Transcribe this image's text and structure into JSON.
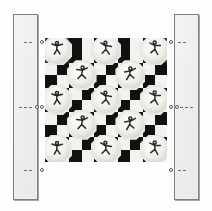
{
  "figure": {
    "background_color": "#fefefe"
  },
  "panels": [
    {
      "name": "left-rail",
      "label": "",
      "x": 13,
      "y": 14,
      "width": 25,
      "height": 186,
      "fill": "#f1f1f1",
      "stroke": "#7d7d7d"
    },
    {
      "name": "right-rail",
      "label": "",
      "x": 174,
      "y": 14,
      "width": 25,
      "height": 186,
      "fill": "#f1f1f1",
      "stroke": "#7d7d7d"
    }
  ],
  "board": {
    "name": "checkerboard-panel",
    "x": 45,
    "y": 38,
    "width": 122,
    "height": 124,
    "columns": 10,
    "rows": 10,
    "dark_color": "#111111",
    "light_color": "#f3f2ee",
    "mid_color": "#3a3a3a",
    "pattern": [
      "MMDLDLDLDM",
      "MMDLDLDLDM",
      "LDLDLDLDLD",
      "DLDLDLDLDL",
      "LDLDLDLDLD",
      "DLDLDLDLDL",
      "LDLDLDLDLD",
      "DLDLDLDLDL",
      "LDLDLDLDLD",
      "DLDLDLDLDL"
    ]
  },
  "medallions": {
    "name": "figure-medallion",
    "size": 30,
    "fill": "#e8e7e2",
    "items": [
      {
        "row": 0,
        "col": 0,
        "figure": "dancer-arms-raised"
      },
      {
        "row": 0,
        "col": 2,
        "figure": "dancer-striding"
      },
      {
        "row": 0,
        "col": 4,
        "figure": "dancer-leaping"
      },
      {
        "row": 1,
        "col": 1,
        "figure": "dancer-kneeling"
      },
      {
        "row": 1,
        "col": 3,
        "figure": "dancer-turning"
      },
      {
        "row": 2,
        "col": 0,
        "figure": "dancer-crouching"
      },
      {
        "row": 2,
        "col": 2,
        "figure": "dancer-running"
      },
      {
        "row": 2,
        "col": 4,
        "figure": "dancer-reaching"
      },
      {
        "row": 3,
        "col": 1,
        "figure": "dancer-bowing"
      },
      {
        "row": 3,
        "col": 3,
        "figure": "dancer-spinning"
      },
      {
        "row": 4,
        "col": 0,
        "figure": "dancer-stretching"
      },
      {
        "row": 4,
        "col": 2,
        "figure": "dancer-stepping"
      },
      {
        "row": 4,
        "col": 4,
        "figure": "dancer-jumping"
      }
    ]
  },
  "connectors": [
    {
      "name": "connector-top-left",
      "side": "left",
      "y": 42,
      "dash_from": 24,
      "dash_to": 34,
      "node_x": 40,
      "style": "dashed"
    },
    {
      "name": "connector-middle-left",
      "side": "left",
      "y": 107,
      "dash_from": 19,
      "dash_to": 33,
      "node_x": 40,
      "extra_node_x": 35,
      "style": "dashed"
    },
    {
      "name": "connector-bottom-left",
      "side": "left",
      "y": 170,
      "dash_from": 24,
      "dash_to": 34,
      "node_x": 40,
      "style": "dashed"
    },
    {
      "name": "connector-top-right",
      "side": "right",
      "y": 42,
      "dash_from": 178,
      "dash_to": 188,
      "node_x": 169,
      "style": "dashed"
    },
    {
      "name": "connector-middle-right",
      "side": "right",
      "y": 107,
      "dash_from": 180,
      "dash_to": 194,
      "node_x": 169,
      "extra_node_x": 175,
      "style": "dashed"
    },
    {
      "name": "connector-bottom-right",
      "side": "right",
      "y": 170,
      "dash_from": 178,
      "dash_to": 188,
      "node_x": 169,
      "style": "dashed"
    }
  ]
}
